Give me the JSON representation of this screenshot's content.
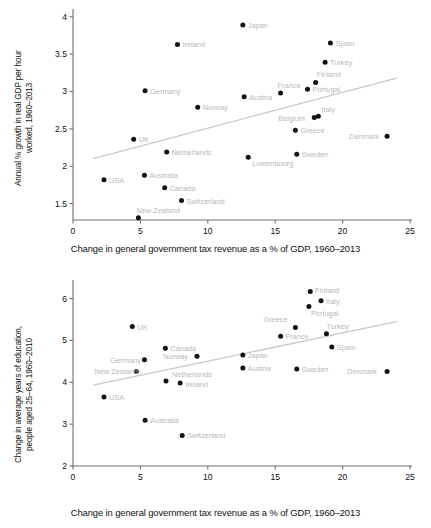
{
  "xlabel_shared": "Change in general government tax revenue as a % of GDP, 1960–2013",
  "chart_data": [
    {
      "type": "scatter",
      "id": "top",
      "title": "",
      "xlabel": "Change in general government tax revenue as a % of GDP, 1960–2013",
      "ylabel": "Annual % growth in real GDP per hour\nworked, 1960–2013",
      "xlim": [
        0,
        25
      ],
      "ylim": [
        1.28,
        4.05
      ],
      "xticks": [
        0,
        5,
        10,
        15,
        20,
        25
      ],
      "xticklabels": [
        "0",
        "5",
        "10",
        "15",
        "20",
        "25"
      ],
      "yticks": [
        1.5,
        2,
        2.5,
        3,
        3.5,
        4
      ],
      "yticklabels": [
        "1.5",
        "2",
        "2.5",
        "3",
        "3.5",
        "4"
      ],
      "grid": false,
      "legend": "none",
      "trendline": {
        "x0": 1.5,
        "y0": 2.1,
        "x1": 24.0,
        "y1": 3.18,
        "color": "#c9c9c9"
      },
      "point_color": "#111111",
      "label_color": "#bcbcbc",
      "points": [
        {
          "label": "USA",
          "x": 2.3,
          "y": 1.82,
          "lx": 5,
          "ly": 3
        },
        {
          "label": "UK",
          "x": 4.5,
          "y": 2.36,
          "lx": 5,
          "ly": 3
        },
        {
          "label": "New Zealand",
          "x": 4.85,
          "y": 1.31,
          "lx": -2,
          "ly": -5
        },
        {
          "label": "Australia",
          "x": 5.3,
          "y": 1.88,
          "lx": 5,
          "ly": 3
        },
        {
          "label": "Germany",
          "x": 5.35,
          "y": 3.01,
          "lx": 5,
          "ly": 3
        },
        {
          "label": "Canada",
          "x": 6.8,
          "y": 1.71,
          "lx": 5,
          "ly": 3
        },
        {
          "label": "Netherlands",
          "x": 6.95,
          "y": 2.19,
          "lx": 5,
          "ly": 3
        },
        {
          "label": "Ireland",
          "x": 7.75,
          "y": 3.63,
          "lx": 5,
          "ly": 3
        },
        {
          "label": "Switzerland",
          "x": 8.05,
          "y": 1.54,
          "lx": 5,
          "ly": 3
        },
        {
          "label": "Norway",
          "x": 9.25,
          "y": 2.79,
          "lx": 5,
          "ly": 3
        },
        {
          "label": "Japan",
          "x": 12.6,
          "y": 3.89,
          "lx": 5,
          "ly": 3
        },
        {
          "label": "Austria",
          "x": 12.7,
          "y": 2.93,
          "lx": 5,
          "ly": 3
        },
        {
          "label": "Luxembourg",
          "x": 13.0,
          "y": 2.12,
          "lx": 4,
          "ly": 9
        },
        {
          "label": "France",
          "x": 15.4,
          "y": 2.98,
          "lx": -3,
          "ly": -5
        },
        {
          "label": "Greece",
          "x": 16.5,
          "y": 2.48,
          "lx": 5,
          "ly": 3
        },
        {
          "label": "Sweden",
          "x": 16.6,
          "y": 2.16,
          "lx": 5,
          "ly": 3
        },
        {
          "label": "Portugal",
          "x": 17.4,
          "y": 3.03,
          "lx": 5,
          "ly": 3
        },
        {
          "label": "Belgium",
          "x": 17.9,
          "y": 2.65,
          "lx": -36,
          "ly": 3
        },
        {
          "label": "Italy",
          "x": 18.2,
          "y": 2.67,
          "lx": 3,
          "ly": -4
        },
        {
          "label": "Finland",
          "x": 18.0,
          "y": 3.12,
          "lx": 1,
          "ly": -5
        },
        {
          "label": "Turkey",
          "x": 18.7,
          "y": 3.39,
          "lx": 5,
          "ly": 3
        },
        {
          "label": "Spain",
          "x": 19.1,
          "y": 3.65,
          "lx": 5,
          "ly": 3
        },
        {
          "label": "Denmark",
          "x": 23.3,
          "y": 2.4,
          "lx": -38,
          "ly": 3
        }
      ]
    },
    {
      "type": "scatter",
      "id": "bottom",
      "title": "",
      "xlabel": "Change in general government tax revenue as a % of GDP, 1960–2013",
      "ylabel": "Change in average years of education,\npeople aged 25–64, 1960–2010",
      "xlim": [
        0,
        25
      ],
      "ylim": [
        2,
        6.3
      ],
      "xticks": [
        0,
        5,
        10,
        15,
        20,
        25
      ],
      "xticklabels": [
        "0",
        "5",
        "10",
        "15",
        "20",
        "25"
      ],
      "yticks": [
        2,
        3,
        4,
        5,
        6
      ],
      "yticklabels": [
        "2",
        "3",
        "4",
        "5",
        "6"
      ],
      "grid": false,
      "legend": "none",
      "trendline": {
        "x0": 1.5,
        "y0": 3.93,
        "x1": 24.0,
        "y1": 5.45,
        "color": "#c9c9c9"
      },
      "point_color": "#111111",
      "label_color": "#bcbcbc",
      "points": [
        {
          "label": "USA",
          "x": 2.3,
          "y": 3.65,
          "lx": 5,
          "ly": 3
        },
        {
          "label": "UK",
          "x": 4.4,
          "y": 5.33,
          "lx": 5,
          "ly": 3
        },
        {
          "label": "New Zealand",
          "x": 4.7,
          "y": 4.26,
          "lx": -42,
          "ly": 3
        },
        {
          "label": "Germany",
          "x": 5.3,
          "y": 4.54,
          "lx": -34,
          "ly": 3
        },
        {
          "label": "Australia",
          "x": 5.35,
          "y": 3.09,
          "lx": 5,
          "ly": 3
        },
        {
          "label": "Canada",
          "x": 6.85,
          "y": 4.81,
          "lx": 5,
          "ly": 3
        },
        {
          "label": "Netherlands",
          "x": 6.9,
          "y": 4.03,
          "lx": 6,
          "ly": -4
        },
        {
          "label": "Ireland",
          "x": 7.95,
          "y": 3.98,
          "lx": 5,
          "ly": 4
        },
        {
          "label": "Switzerland",
          "x": 8.1,
          "y": 2.73,
          "lx": 5,
          "ly": 3
        },
        {
          "label": "Norway",
          "x": 9.2,
          "y": 4.62,
          "lx": -34,
          "ly": 3
        },
        {
          "label": "Japan",
          "x": 12.6,
          "y": 4.65,
          "lx": 5,
          "ly": 3
        },
        {
          "label": "Austria",
          "x": 12.6,
          "y": 4.34,
          "lx": 5,
          "ly": 3
        },
        {
          "label": "France",
          "x": 15.4,
          "y": 5.1,
          "lx": 5,
          "ly": 3
        },
        {
          "label": "Greece",
          "x": 16.5,
          "y": 5.31,
          "lx": -32,
          "ly": -5
        },
        {
          "label": "Sweden",
          "x": 16.6,
          "y": 4.32,
          "lx": 5,
          "ly": 3
        },
        {
          "label": "Portugal",
          "x": 17.5,
          "y": 5.81,
          "lx": 2,
          "ly": 9
        },
        {
          "label": "Finland",
          "x": 17.6,
          "y": 6.17,
          "lx": 5,
          "ly": 2
        },
        {
          "label": "Italy",
          "x": 18.4,
          "y": 5.95,
          "lx": 5,
          "ly": 3
        },
        {
          "label": "Turkey",
          "x": 18.8,
          "y": 5.16,
          "lx": 0,
          "ly": -5
        },
        {
          "label": "Spain",
          "x": 19.2,
          "y": 4.84,
          "lx": 5,
          "ly": 3
        },
        {
          "label": "Denmark",
          "x": 23.3,
          "y": 4.26,
          "lx": -40,
          "ly": 3
        }
      ]
    }
  ]
}
